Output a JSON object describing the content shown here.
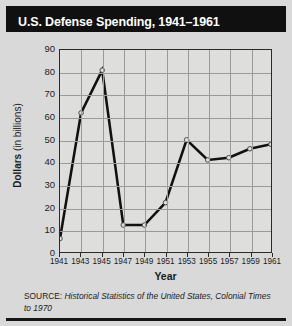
{
  "chart_title": "U.S. Defense Spending, 1941–1961",
  "axes": {
    "y_title_bold": "Dollars",
    "y_title_rest": " (in billions)",
    "x_title": "Year"
  },
  "source": {
    "label": "SOURCE: ",
    "title": "Historical Statistics of the United States, Colonial Times to 1970"
  },
  "colors": {
    "banner_background": "#101010",
    "title_text": "#ffffff",
    "page_background": "#d9d9d9",
    "plot_background": "#dededc",
    "gridline": "#9a9a9a",
    "axis_border": "#2a2a2a",
    "series_line": "#111111",
    "marker_fill": "#dededc",
    "bottom_rule": "#151515"
  },
  "chart_data": {
    "type": "line",
    "title": "U.S. Defense Spending, 1941–1961",
    "xlabel": "Year",
    "ylabel": "Dollars (in billions)",
    "ylim": [
      0,
      90
    ],
    "ytick_step": 10,
    "yticks": [
      0,
      10,
      20,
      30,
      40,
      50,
      60,
      70,
      80,
      90
    ],
    "xlim": [
      1941,
      1961
    ],
    "xticks": [
      1941,
      1943,
      1945,
      1947,
      1949,
      1951,
      1953,
      1955,
      1957,
      1959,
      1961
    ],
    "categories": [
      "1941",
      "1943",
      "1945",
      "1947",
      "1949",
      "1951",
      "1953",
      "1955",
      "1957",
      "1959",
      "1961"
    ],
    "x": [
      1941,
      1943,
      1945,
      1947,
      1949,
      1951,
      1953,
      1955,
      1957,
      1959,
      1961
    ],
    "values": [
      6,
      62,
      81,
      12,
      12,
      22,
      50,
      41,
      42,
      46,
      48
    ],
    "series": [
      {
        "name": "U.S. Defense Spending",
        "values": [
          6,
          62,
          81,
          12,
          12,
          22,
          50,
          41,
          42,
          46,
          48
        ]
      }
    ],
    "grid": true,
    "legend": "none",
    "marker": "open-circle"
  }
}
